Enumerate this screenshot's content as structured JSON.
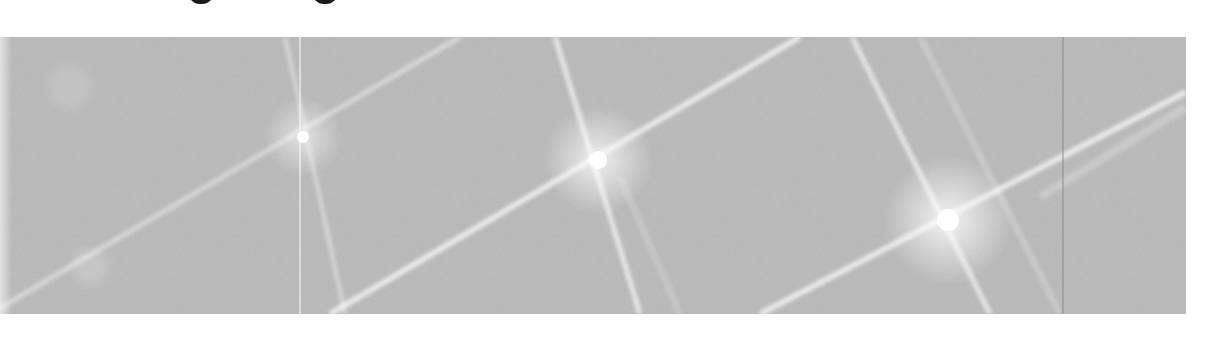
{
  "image": {
    "description": "Grayscale scanned figure: a textured gray rectangle with three star-shaped diffraction/lens flare spots connected by bright diagonal streaks",
    "background_color": "#ffffff",
    "panel_color": "#b9b9b9",
    "header_fragment": {
      "visible_glyphs": [
        "g",
        "g"
      ],
      "note": "descenders of cropped text line at top edge"
    },
    "flares": [
      {
        "name": "flare-left",
        "cx": 303,
        "cy": 100,
        "intensity": 0.8
      },
      {
        "name": "flare-center",
        "cx": 598,
        "cy": 123,
        "intensity": 1.0
      },
      {
        "name": "flare-right",
        "cx": 948,
        "cy": 183,
        "intensity": 1.0
      }
    ],
    "seams": [
      {
        "x": 300,
        "color": "#e8e8e8"
      },
      {
        "x": 1063,
        "color": "#8c8c8c"
      }
    ]
  }
}
